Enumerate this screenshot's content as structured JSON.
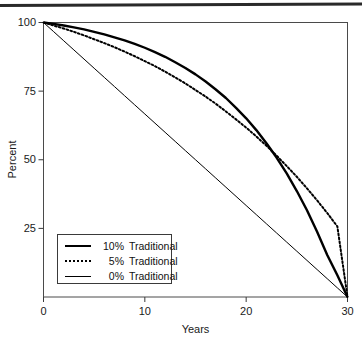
{
  "figure": {
    "background": "#ffffff",
    "ink": "#000000",
    "page_rule": "horizontal-rule"
  },
  "chart_data": {
    "type": "line",
    "title": "",
    "subtitle": "",
    "xlabel": "Years",
    "ylabel": "Percent",
    "xlim": [
      0,
      30
    ],
    "ylim": [
      0,
      100
    ],
    "xticks": [
      0,
      10,
      20,
      30
    ],
    "xticklabels": [
      "0",
      "10",
      "20",
      "30"
    ],
    "yticks": [
      25,
      50,
      75,
      100
    ],
    "yticklabels": [
      "25",
      "50",
      "75",
      "100"
    ],
    "grid": false,
    "frame": "box",
    "legend_position": "lower-left",
    "x": [
      0,
      1,
      2,
      3,
      4,
      5,
      6,
      7,
      8,
      9,
      10,
      11,
      12,
      13,
      14,
      15,
      16,
      17,
      18,
      19,
      20,
      21,
      22,
      23,
      24,
      25,
      26,
      27,
      28,
      29,
      30
    ],
    "series": [
      {
        "name": "10% Traditional",
        "rate": "10%",
        "style": "thick-solid",
        "color": "#000000",
        "values": [
          100.0,
          99.5,
          98.9,
          98.2,
          97.5,
          96.6,
          95.7,
          94.6,
          93.5,
          92.2,
          90.8,
          89.2,
          87.5,
          85.5,
          83.4,
          81.1,
          78.5,
          75.6,
          72.5,
          68.9,
          65.1,
          60.8,
          56.0,
          50.8,
          45.0,
          38.6,
          31.6,
          23.8,
          15.3,
          7.9,
          0.0
        ]
      },
      {
        "name": "5% Traditional",
        "rate": "5%",
        "style": "dotted",
        "color": "#000000",
        "values": [
          100.0,
          98.9,
          97.8,
          96.6,
          95.3,
          93.9,
          92.5,
          91.0,
          89.4,
          87.7,
          85.9,
          84.1,
          82.1,
          80.0,
          77.8,
          75.4,
          73.0,
          70.4,
          67.6,
          64.7,
          61.7,
          58.5,
          55.1,
          51.5,
          47.7,
          43.8,
          39.6,
          35.2,
          30.6,
          25.7,
          0.0
        ]
      },
      {
        "name": "0% Traditional",
        "rate": "0%",
        "style": "thin-solid",
        "color": "#000000",
        "values": [
          100.0,
          96.67,
          93.33,
          90.0,
          86.67,
          83.33,
          80.0,
          76.67,
          73.33,
          70.0,
          66.67,
          63.33,
          60.0,
          56.67,
          53.33,
          50.0,
          46.67,
          43.33,
          40.0,
          36.67,
          33.33,
          30.0,
          26.67,
          23.33,
          20.0,
          16.67,
          13.33,
          10.0,
          6.67,
          3.33,
          0.0
        ]
      }
    ]
  },
  "legend": {
    "items": [
      {
        "pct": "10%",
        "label": "Traditional"
      },
      {
        "pct": "5%",
        "label": "Traditional"
      },
      {
        "pct": "0%",
        "label": "Traditional"
      }
    ]
  },
  "axes": {
    "y_tick_labels": [
      "100",
      "75",
      "50",
      "25"
    ],
    "x_tick_labels": [
      "0",
      "10",
      "20",
      "30"
    ],
    "x_title": "Years",
    "y_title": "Percent"
  }
}
